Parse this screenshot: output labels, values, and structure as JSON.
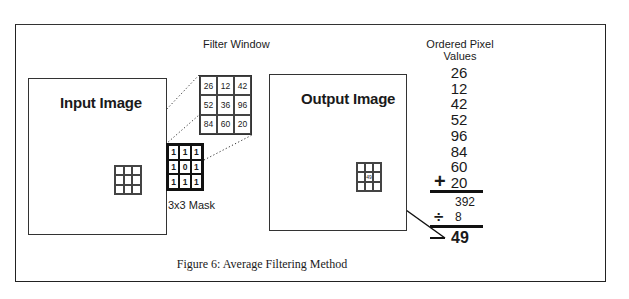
{
  "figure": {
    "caption": "Figure 6: Average Filtering Method",
    "input_image": {
      "label": "Input Image"
    },
    "output_image": {
      "label": "Output Image",
      "center_value": "49"
    },
    "filter_window": {
      "label": "Filter Window",
      "values": [
        [
          "26",
          "12",
          "42"
        ],
        [
          "52",
          "36",
          "96"
        ],
        [
          "84",
          "60",
          "20"
        ]
      ]
    },
    "mask": {
      "label": "3x3 Mask",
      "values": [
        [
          "1",
          "1",
          "1"
        ],
        [
          "1",
          "0",
          "1"
        ],
        [
          "1",
          "1",
          "1"
        ]
      ]
    },
    "ordered_values": {
      "title_line1": "Ordered Pixel",
      "title_line2": "Values",
      "values": [
        "26",
        "12",
        "42",
        "52",
        "96",
        "84",
        "60",
        "20"
      ],
      "plus_symbol": "+",
      "sum": "392",
      "divide_symbol": "÷",
      "divisor": "8",
      "minus_symbol": "—",
      "result": "49"
    }
  }
}
